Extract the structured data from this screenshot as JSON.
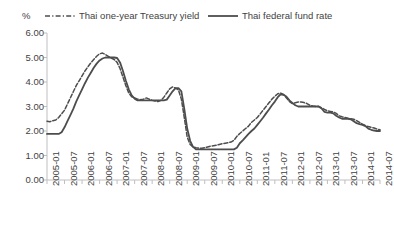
{
  "chart_data": {
    "type": "line",
    "title": "",
    "subtitle": "",
    "xlabel": "",
    "ylabel": "%",
    "ylim": [
      0.0,
      6.0
    ],
    "ytick_step": 1.0,
    "ytick_labels": [
      "0.00",
      "1.00",
      "2.00",
      "3.00",
      "4.00",
      "5.00",
      "6.00"
    ],
    "ytick_values": [
      0.0,
      1.0,
      2.0,
      3.0,
      4.0,
      5.0,
      6.0
    ],
    "grid": false,
    "legend_position": "top",
    "xtick_labels": [
      "2005-01",
      "2005-07",
      "2006-01",
      "2006-07",
      "2007-01",
      "2007-07",
      "2008-01",
      "2008-07",
      "2009-01",
      "2009-07",
      "2010-01",
      "2010-07",
      "2011-01",
      "2011-07",
      "2012-01",
      "2012-07",
      "2013-01",
      "2013-07",
      "2014-01",
      "2014-07"
    ],
    "x": [
      "2005-01",
      "2005-02",
      "2005-03",
      "2005-04",
      "2005-05",
      "2005-06",
      "2005-07",
      "2005-08",
      "2005-09",
      "2005-10",
      "2005-11",
      "2005-12",
      "2006-01",
      "2006-02",
      "2006-03",
      "2006-04",
      "2006-05",
      "2006-06",
      "2006-07",
      "2006-08",
      "2006-09",
      "2006-10",
      "2006-11",
      "2006-12",
      "2007-01",
      "2007-02",
      "2007-03",
      "2007-04",
      "2007-05",
      "2007-06",
      "2007-07",
      "2007-08",
      "2007-09",
      "2007-10",
      "2007-11",
      "2007-12",
      "2008-01",
      "2008-02",
      "2008-03",
      "2008-04",
      "2008-05",
      "2008-06",
      "2008-07",
      "2008-08",
      "2008-09",
      "2008-10",
      "2008-11",
      "2008-12",
      "2009-01",
      "2009-02",
      "2009-03",
      "2009-04",
      "2009-05",
      "2009-06",
      "2009-07",
      "2009-08",
      "2009-09",
      "2009-10",
      "2009-11",
      "2009-12",
      "2010-01",
      "2010-02",
      "2010-03",
      "2010-04",
      "2010-05",
      "2010-06",
      "2010-07",
      "2010-08",
      "2010-09",
      "2010-10",
      "2010-11",
      "2010-12",
      "2011-01",
      "2011-02",
      "2011-03",
      "2011-04",
      "2011-05",
      "2011-06",
      "2011-07",
      "2011-08",
      "2011-09",
      "2011-10",
      "2011-11",
      "2011-12",
      "2012-01",
      "2012-02",
      "2012-03",
      "2012-04",
      "2012-05",
      "2012-06",
      "2012-07",
      "2012-08",
      "2012-09",
      "2012-10",
      "2012-11",
      "2012-12",
      "2013-01",
      "2013-02",
      "2013-03",
      "2013-04",
      "2013-05",
      "2013-06",
      "2013-07",
      "2013-08",
      "2013-09",
      "2013-10",
      "2013-11",
      "2013-12",
      "2014-01",
      "2014-02",
      "2014-03",
      "2014-04",
      "2014-05",
      "2014-06",
      "2014-07"
    ],
    "series": [
      {
        "name": "Thai one-year Treasury yield",
        "style": "dashed",
        "color": "#4d4d4d",
        "values": [
          2.4,
          2.38,
          2.42,
          2.45,
          2.55,
          2.7,
          2.85,
          3.1,
          3.35,
          3.6,
          3.85,
          4.05,
          4.25,
          4.45,
          4.62,
          4.78,
          4.92,
          5.05,
          5.15,
          5.18,
          5.12,
          5.05,
          4.98,
          4.92,
          4.8,
          4.55,
          4.2,
          3.85,
          3.55,
          3.4,
          3.35,
          3.3,
          3.28,
          3.3,
          3.35,
          3.3,
          3.25,
          3.22,
          3.2,
          3.25,
          3.38,
          3.55,
          3.72,
          3.8,
          3.75,
          3.68,
          3.3,
          2.55,
          1.75,
          1.45,
          1.35,
          1.32,
          1.3,
          1.3,
          1.32,
          1.35,
          1.38,
          1.4,
          1.42,
          1.45,
          1.48,
          1.5,
          1.52,
          1.55,
          1.62,
          1.78,
          1.9,
          2.0,
          2.1,
          2.2,
          2.35,
          2.45,
          2.55,
          2.7,
          2.85,
          3.0,
          3.15,
          3.3,
          3.42,
          3.52,
          3.55,
          3.48,
          3.35,
          3.2,
          3.12,
          3.15,
          3.18,
          3.18,
          3.16,
          3.12,
          3.05,
          3.02,
          3.0,
          3.0,
          2.95,
          2.88,
          2.82,
          2.8,
          2.78,
          2.72,
          2.62,
          2.58,
          2.55,
          2.52,
          2.5,
          2.48,
          2.42,
          2.35,
          2.28,
          2.22,
          2.18,
          2.15,
          2.12,
          2.08,
          2.05
        ]
      },
      {
        "name": "Thai federal fund rate",
        "style": "solid",
        "color": "#4d4d4d",
        "values": [
          1.88,
          1.88,
          1.88,
          1.88,
          1.88,
          1.95,
          2.15,
          2.4,
          2.65,
          2.9,
          3.2,
          3.45,
          3.7,
          3.95,
          4.18,
          4.38,
          4.58,
          4.75,
          4.88,
          4.96,
          5.0,
          5.0,
          5.0,
          5.0,
          4.98,
          4.8,
          4.45,
          4.05,
          3.7,
          3.45,
          3.32,
          3.25,
          3.25,
          3.25,
          3.25,
          3.25,
          3.25,
          3.25,
          3.25,
          3.25,
          3.25,
          3.28,
          3.45,
          3.62,
          3.75,
          3.75,
          3.62,
          2.9,
          2.1,
          1.6,
          1.35,
          1.25,
          1.25,
          1.25,
          1.25,
          1.25,
          1.25,
          1.25,
          1.25,
          1.25,
          1.25,
          1.25,
          1.25,
          1.25,
          1.25,
          1.32,
          1.5,
          1.62,
          1.75,
          1.88,
          2.0,
          2.1,
          2.25,
          2.4,
          2.55,
          2.72,
          2.88,
          3.05,
          3.2,
          3.38,
          3.5,
          3.48,
          3.4,
          3.25,
          3.15,
          3.05,
          3.0,
          3.0,
          3.0,
          3.0,
          3.0,
          3.0,
          3.0,
          3.0,
          2.92,
          2.78,
          2.75,
          2.75,
          2.72,
          2.62,
          2.55,
          2.5,
          2.5,
          2.5,
          2.48,
          2.4,
          2.32,
          2.28,
          2.25,
          2.2,
          2.1,
          2.05,
          2.02,
          2.0,
          2.0
        ]
      }
    ]
  },
  "legend": {
    "entries": [
      {
        "label": "Thai one-year Treasury yield",
        "style": "dashed"
      },
      {
        "label": "Thai federal fund rate",
        "style": "solid"
      }
    ]
  },
  "axis": {
    "unit_label": "%"
  }
}
